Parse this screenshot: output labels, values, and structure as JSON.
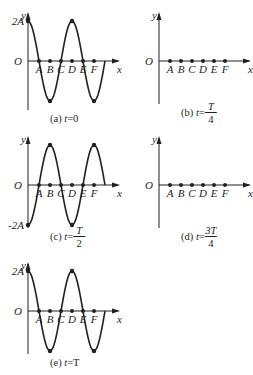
{
  "figure": {
    "axis_labels": {
      "x": "x",
      "y": "y",
      "origin": "O"
    },
    "point_labels": [
      "A",
      "B",
      "C",
      "D",
      "E",
      "F"
    ],
    "panels": [
      {
        "id": "a",
        "caption_prefix": "(a) ",
        "caption_var": "t",
        "caption_eq": "=0",
        "caption_frac": null,
        "y_label": "2A",
        "y_label_pos": "top",
        "waveform": "cos",
        "amplitude_label": "2A",
        "has_curve": true
      },
      {
        "id": "b",
        "caption_prefix": "(b) ",
        "caption_var": "t",
        "caption_eq": "=",
        "caption_frac": {
          "num": "T",
          "den": "4"
        },
        "y_label": "",
        "waveform": "flat",
        "has_curve": false
      },
      {
        "id": "c",
        "caption_prefix": "(c) ",
        "caption_var": "t",
        "caption_eq": "=",
        "caption_frac": {
          "num": "T",
          "den": "2"
        },
        "y_label": "-2A",
        "y_label_pos": "bottom",
        "waveform": "-cos",
        "amplitude_label": "-2A",
        "has_curve": true
      },
      {
        "id": "d",
        "caption_prefix": "(d) ",
        "caption_var": "t",
        "caption_eq": "=",
        "caption_frac": {
          "num": "3T",
          "den": "4"
        },
        "y_label": "",
        "waveform": "flat",
        "has_curve": false
      },
      {
        "id": "e",
        "caption_prefix": "(e) ",
        "caption_var": "t",
        "caption_eq": "=T",
        "caption_frac": null,
        "y_label": "2A",
        "y_label_pos": "top",
        "waveform": "cos",
        "amplitude_label": "2A",
        "has_curve": true
      }
    ]
  }
}
